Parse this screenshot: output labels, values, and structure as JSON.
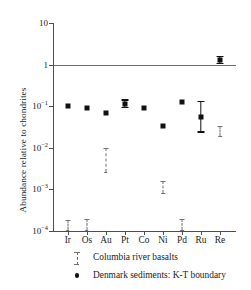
{
  "chart_data": {
    "type": "scatter",
    "title": "",
    "xlabel": "",
    "ylabel": "Abundance relative to chondrites",
    "y_scale": "log",
    "ylim": [
      0.0001,
      10
    ],
    "ytick_values": [
      10,
      1,
      0.1,
      0.01,
      0.001,
      0.0001
    ],
    "ytick_labels": [
      "10",
      "1",
      "10⁻¹",
      "10⁻²",
      "10⁻³",
      "10⁻⁴"
    ],
    "ytick_mantissas": [
      "10",
      "1",
      "10",
      "10",
      "10",
      "10"
    ],
    "ytick_exponents": [
      "",
      "",
      "-1",
      "-2",
      "-3",
      "-4"
    ],
    "categories": [
      "Ir",
      "Os",
      "Au",
      "Pt",
      "Co",
      "Ni",
      "Pd",
      "Ru",
      "Re"
    ],
    "grid": false,
    "reference_line": {
      "value": 1,
      "label": "chondritic abundance"
    },
    "legend_position": "below-axes",
    "series": [
      {
        "name": "Denmark sediments: K-T boundary",
        "marker": "square",
        "style": "solid",
        "points": [
          {
            "x": "Ir",
            "y": 0.1,
            "ylow": null,
            "yhigh": null
          },
          {
            "x": "Os",
            "y": 0.092,
            "ylow": null,
            "yhigh": null
          },
          {
            "x": "Au",
            "y": 0.07,
            "ylow": null,
            "yhigh": null
          },
          {
            "x": "Pt",
            "y": 0.115,
            "ylow": 0.096,
            "yhigh": 0.145
          },
          {
            "x": "Co",
            "y": 0.092,
            "ylow": null,
            "yhigh": null
          },
          {
            "x": "Ni",
            "y": 0.033,
            "ylow": null,
            "yhigh": null
          },
          {
            "x": "Pd",
            "y": 0.125,
            "ylow": null,
            "yhigh": null
          },
          {
            "x": "Ru",
            "y": 0.056,
            "ylow": 0.025,
            "yhigh": 0.135
          },
          {
            "x": "Re",
            "y": 1.3,
            "ylow": 1.1,
            "yhigh": 1.6
          }
        ]
      },
      {
        "name": "Columbia river basalts",
        "marker": "range",
        "style": "dashed",
        "points": [
          {
            "x": "Ir",
            "y": null,
            "ylow": 0.000105,
            "yhigh": 0.00018
          },
          {
            "x": "Os",
            "y": null,
            "ylow": 0.000105,
            "yhigh": 0.00019
          },
          {
            "x": "Au",
            "y": null,
            "ylow": 0.0026,
            "yhigh": 0.0098
          },
          {
            "x": "Ni",
            "y": null,
            "ylow": 0.00082,
            "yhigh": 0.0016
          },
          {
            "x": "Pd",
            "y": null,
            "ylow": 0.000105,
            "yhigh": 0.00019
          },
          {
            "x": "Re",
            "y": null,
            "ylow": 0.019,
            "yhigh": 0.034
          }
        ]
      }
    ]
  },
  "legend": {
    "entries": [
      {
        "label": "Columbia river basalts",
        "key": "range-dashed"
      },
      {
        "label": "Denmark sediments: K-T boundary",
        "key": "dot-solid"
      }
    ]
  }
}
